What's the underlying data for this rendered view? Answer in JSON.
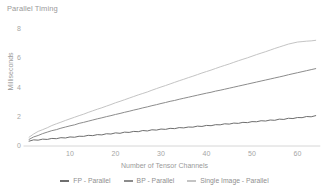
{
  "chart_data": {
    "type": "line",
    "title": "Parallel Timing",
    "xlabel": "Number of Tensor Channels",
    "ylabel": "Milliseconds",
    "xlim": [
      0,
      65
    ],
    "ylim": [
      0,
      8.6
    ],
    "grid": false,
    "legend_position": "bottom",
    "xticks": [
      10,
      20,
      30,
      40,
      50,
      60
    ],
    "yticks": [
      0,
      2,
      4,
      6,
      8
    ],
    "x": [
      1,
      2,
      3,
      4,
      5,
      6,
      7,
      8,
      9,
      10,
      11,
      12,
      13,
      14,
      15,
      16,
      17,
      18,
      19,
      20,
      21,
      22,
      23,
      24,
      25,
      26,
      27,
      28,
      29,
      30,
      31,
      32,
      33,
      34,
      35,
      36,
      37,
      38,
      39,
      40,
      41,
      42,
      43,
      44,
      45,
      46,
      47,
      48,
      49,
      50,
      51,
      52,
      53,
      54,
      55,
      56,
      57,
      58,
      59,
      60,
      61,
      62,
      63,
      64
    ],
    "series": [
      {
        "name": "FP - Parallel",
        "color": "#6e6e6e",
        "values": [
          0.33,
          0.42,
          0.4,
          0.47,
          0.45,
          0.52,
          0.5,
          0.57,
          0.55,
          0.62,
          0.6,
          0.67,
          0.66,
          0.73,
          0.71,
          0.78,
          0.76,
          0.84,
          0.82,
          0.9,
          0.87,
          0.95,
          0.93,
          1.0,
          0.98,
          1.06,
          1.03,
          1.11,
          1.09,
          1.16,
          1.14,
          1.21,
          1.19,
          1.26,
          1.24,
          1.3,
          1.29,
          1.36,
          1.34,
          1.41,
          1.39,
          1.46,
          1.45,
          1.52,
          1.5,
          1.57,
          1.55,
          1.62,
          1.6,
          1.67,
          1.66,
          1.73,
          1.71,
          1.78,
          1.76,
          1.84,
          1.82,
          1.9,
          1.88,
          1.95,
          1.94,
          2.02,
          2.0,
          2.08
        ]
      },
      {
        "name": "BP - Parallel",
        "color": "#8c8c8c",
        "values": [
          0.45,
          0.62,
          0.72,
          0.85,
          0.95,
          1.05,
          1.12,
          1.22,
          1.3,
          1.38,
          1.45,
          1.55,
          1.62,
          1.7,
          1.78,
          1.86,
          1.93,
          2.01,
          2.08,
          2.16,
          2.23,
          2.31,
          2.38,
          2.46,
          2.53,
          2.61,
          2.68,
          2.76,
          2.83,
          2.91,
          2.98,
          3.06,
          3.12,
          3.2,
          3.27,
          3.34,
          3.41,
          3.48,
          3.55,
          3.62,
          3.68,
          3.76,
          3.82,
          3.89,
          3.96,
          4.03,
          4.1,
          4.17,
          4.24,
          4.31,
          4.38,
          4.45,
          4.52,
          4.59,
          4.66,
          4.73,
          4.8,
          4.88,
          4.95,
          5.02,
          5.09,
          5.16,
          5.23,
          5.3
        ]
      },
      {
        "name": "Single Image - Parallel",
        "color": "#c4c4c4",
        "values": [
          0.6,
          0.82,
          1.0,
          1.12,
          1.25,
          1.4,
          1.52,
          1.63,
          1.75,
          1.86,
          1.97,
          2.08,
          2.18,
          2.3,
          2.41,
          2.52,
          2.62,
          2.73,
          2.84,
          2.96,
          3.06,
          3.17,
          3.28,
          3.39,
          3.5,
          3.6,
          3.7,
          3.82,
          3.93,
          4.04,
          4.14,
          4.25,
          4.36,
          4.47,
          4.57,
          4.68,
          4.78,
          4.89,
          5.0,
          5.1,
          5.2,
          5.31,
          5.42,
          5.52,
          5.62,
          5.73,
          5.84,
          5.94,
          6.04,
          6.15,
          6.26,
          6.36,
          6.46,
          6.57,
          6.68,
          6.78,
          6.88,
          6.98,
          7.05,
          7.12,
          7.15,
          7.18,
          7.2,
          7.24
        ]
      }
    ]
  },
  "legend": {
    "items": [
      {
        "label": "FP - Parallel",
        "color": "#6e6e6e"
      },
      {
        "label": "BP - Parallel",
        "color": "#8c8c8c"
      },
      {
        "label": "Single Image - Parallel",
        "color": "#c4c4c4"
      }
    ]
  },
  "axis_colors": {
    "axis_line": "#d6d6d6",
    "tick_text": "#a6a6a6",
    "title_text": "#9a9a9a"
  }
}
